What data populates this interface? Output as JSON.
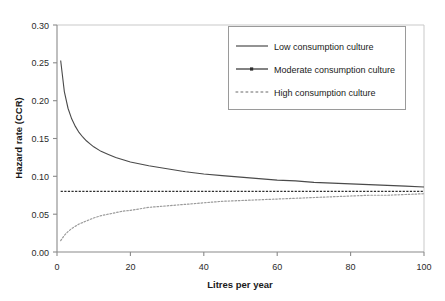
{
  "chart_data": {
    "type": "line",
    "title": "",
    "xlabel": "Litres per year",
    "ylabel": "Hazard rate (CCR)",
    "xlim": [
      0,
      100
    ],
    "ylim": [
      0.0,
      0.3
    ],
    "xticks": [
      0,
      20,
      40,
      60,
      80,
      100
    ],
    "xtick_labels": [
      "0",
      "20",
      "40",
      "60",
      "80",
      "100"
    ],
    "yticks": [
      0.0,
      0.05,
      0.1,
      0.15,
      0.2,
      0.25,
      0.3
    ],
    "ytick_labels": [
      "0.00",
      "0.05",
      "0.10",
      "0.15",
      "0.20",
      "0.25",
      "0.30"
    ],
    "grid": false,
    "legend_position": "upper-right",
    "x": [
      1,
      2,
      3,
      4,
      5,
      6,
      7,
      8,
      9,
      10,
      12,
      14,
      16,
      18,
      20,
      25,
      30,
      35,
      40,
      45,
      50,
      55,
      60,
      65,
      70,
      75,
      80,
      85,
      90,
      95,
      100
    ],
    "series": [
      {
        "name": "Low consumption culture",
        "style": "solid",
        "color": "#4a4a4a",
        "values": [
          0.253,
          0.212,
          0.19,
          0.176,
          0.166,
          0.158,
          0.152,
          0.147,
          0.143,
          0.139,
          0.133,
          0.129,
          0.125,
          0.122,
          0.119,
          0.114,
          0.11,
          0.106,
          0.103,
          0.101,
          0.099,
          0.097,
          0.095,
          0.094,
          0.092,
          0.091,
          0.09,
          0.089,
          0.088,
          0.087,
          0.086
        ]
      },
      {
        "name": "Moderate consumption culture",
        "style": "dash-dot",
        "color": "#2e2e2e",
        "values": [
          0.08,
          0.08,
          0.08,
          0.08,
          0.08,
          0.08,
          0.08,
          0.08,
          0.08,
          0.08,
          0.08,
          0.08,
          0.08,
          0.08,
          0.08,
          0.08,
          0.08,
          0.08,
          0.08,
          0.08,
          0.08,
          0.08,
          0.08,
          0.08,
          0.08,
          0.08,
          0.08,
          0.08,
          0.08,
          0.08,
          0.08
        ]
      },
      {
        "name": "High consumption culture",
        "style": "dotted",
        "color": "#9b9b9b",
        "values": [
          0.015,
          0.022,
          0.027,
          0.031,
          0.034,
          0.037,
          0.039,
          0.041,
          0.043,
          0.045,
          0.048,
          0.05,
          0.052,
          0.054,
          0.055,
          0.059,
          0.061,
          0.063,
          0.065,
          0.067,
          0.068,
          0.069,
          0.07,
          0.071,
          0.072,
          0.073,
          0.074,
          0.075,
          0.075,
          0.076,
          0.077
        ]
      }
    ]
  },
  "legend": {
    "entries": [
      {
        "label": "Low consumption culture"
      },
      {
        "label": "Moderate consumption culture"
      },
      {
        "label": "High consumption culture"
      }
    ]
  }
}
